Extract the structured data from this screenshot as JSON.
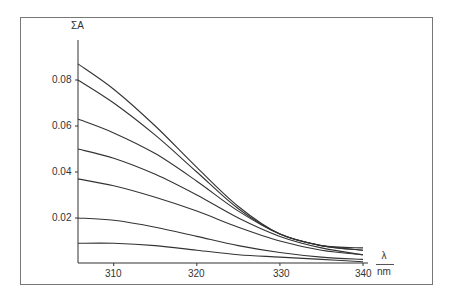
{
  "chart_data": {
    "type": "line",
    "title": "",
    "ylabel": "ΣA",
    "xlabel": "λ",
    "xunit": "nm",
    "xlim": [
      305.7,
      340
    ],
    "ylim": [
      0,
      0.095
    ],
    "grid": false,
    "legend": null,
    "x_ticks": [
      310,
      320,
      330,
      340
    ],
    "x_tick_labels": [
      "310",
      "320",
      "330",
      "340"
    ],
    "y_ticks": [
      0.02,
      0.04,
      0.06,
      0.08
    ],
    "y_tick_labels": [
      "0.02",
      "0.04",
      "0.06",
      "0.08"
    ],
    "x": [
      305.7,
      310,
      315,
      320,
      325,
      330,
      335,
      340
    ],
    "series": [
      {
        "name": "curve 1",
        "values": [
          0.087,
          0.076,
          0.06,
          0.042,
          0.025,
          0.013,
          0.008,
          0.006
        ]
      },
      {
        "name": "curve 2",
        "values": [
          0.08,
          0.07,
          0.056,
          0.04,
          0.024,
          0.013,
          0.008,
          0.006
        ]
      },
      {
        "name": "curve 3",
        "values": [
          0.063,
          0.057,
          0.048,
          0.036,
          0.023,
          0.013,
          0.008,
          0.007
        ]
      },
      {
        "name": "curve 4",
        "values": [
          0.05,
          0.046,
          0.039,
          0.03,
          0.02,
          0.012,
          0.007,
          0.004
        ]
      },
      {
        "name": "curve 5",
        "values": [
          0.037,
          0.034,
          0.029,
          0.023,
          0.016,
          0.01,
          0.006,
          0.004
        ]
      },
      {
        "name": "curve 6",
        "values": [
          0.02,
          0.019,
          0.016,
          0.012,
          0.008,
          0.005,
          0.003,
          0.002
        ]
      },
      {
        "name": "curve 7",
        "values": [
          0.009,
          0.009,
          0.008,
          0.006,
          0.004,
          0.003,
          0.002,
          0.001
        ]
      }
    ],
    "line_color": "#333333"
  },
  "labels": {
    "ylabel": "ΣA",
    "xlabel": "λ",
    "xunit": "nm",
    "yticks": [
      "0.08",
      "0.06",
      "0.04",
      "0.02"
    ],
    "xticks": [
      "310",
      "320",
      "330",
      "340"
    ]
  }
}
